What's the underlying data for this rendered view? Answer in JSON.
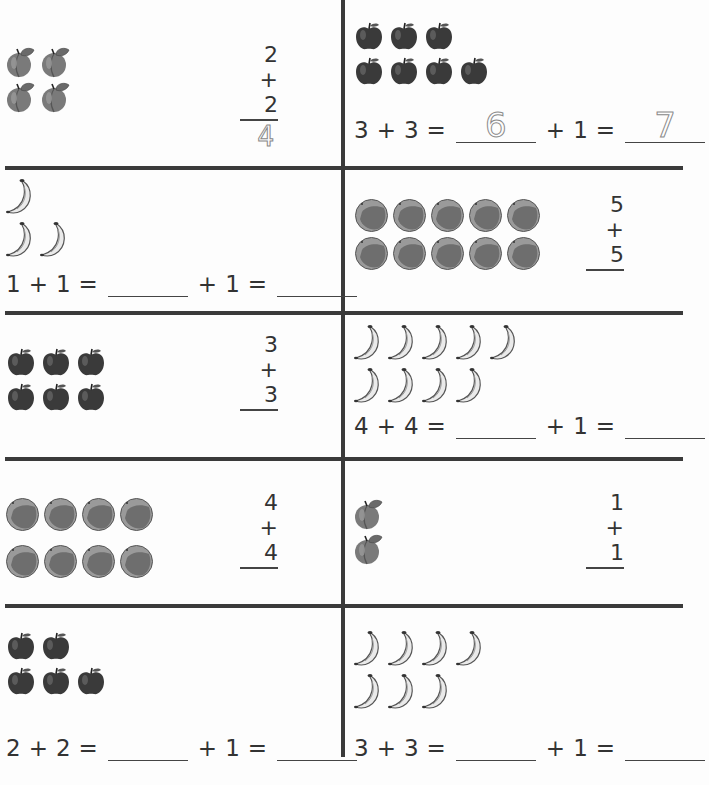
{
  "worksheet": {
    "panels": [
      {
        "id": "p1",
        "fruit": "peach",
        "rows": [
          2,
          2
        ],
        "type": "vertical",
        "top": "2",
        "bottom": "2",
        "operator": "+",
        "traced_answer": "4"
      },
      {
        "id": "p2",
        "fruit": "apple",
        "rows": [
          3,
          4
        ],
        "type": "equation",
        "a": "3",
        "b": "3",
        "add": "1",
        "traced_first": "6",
        "traced_second": "7"
      },
      {
        "id": "p3",
        "fruit": "banana",
        "rows": [
          1,
          2
        ],
        "type": "equation",
        "a": "1",
        "b": "1",
        "add": "1",
        "traced_first": "",
        "traced_second": ""
      },
      {
        "id": "p4",
        "fruit": "orange",
        "rows": [
          5,
          5
        ],
        "type": "vertical",
        "top": "5",
        "bottom": "5",
        "operator": "+",
        "traced_answer": ""
      },
      {
        "id": "p5",
        "fruit": "apple",
        "rows": [
          3,
          3
        ],
        "type": "vertical",
        "top": "3",
        "bottom": "3",
        "operator": "+",
        "traced_answer": ""
      },
      {
        "id": "p6",
        "fruit": "banana",
        "rows": [
          5,
          4
        ],
        "type": "equation",
        "a": "4",
        "b": "4",
        "add": "1",
        "traced_first": "",
        "traced_second": ""
      },
      {
        "id": "p7",
        "fruit": "orange",
        "rows": [
          4,
          4
        ],
        "type": "vertical",
        "top": "4",
        "bottom": "4",
        "operator": "+",
        "traced_answer": ""
      },
      {
        "id": "p8",
        "fruit": "peach",
        "rows": [
          1,
          1
        ],
        "type": "vertical",
        "top": "1",
        "bottom": "1",
        "operator": "+",
        "traced_answer": ""
      },
      {
        "id": "p9",
        "fruit": "apple",
        "rows": [
          2,
          3
        ],
        "type": "equation",
        "a": "2",
        "b": "2",
        "add": "1",
        "traced_first": "",
        "traced_second": ""
      },
      {
        "id": "p10",
        "fruit": "banana",
        "rows": [
          4,
          3
        ],
        "type": "equation",
        "a": "3",
        "b": "3",
        "add": "1",
        "traced_first": "",
        "traced_second": ""
      }
    ],
    "symbols": {
      "plus": "+",
      "equals": "="
    },
    "colors": {
      "ink": "#333333",
      "rule": "#3a3a3a",
      "paper": "#fdfdfd",
      "trace": "#888888"
    }
  }
}
